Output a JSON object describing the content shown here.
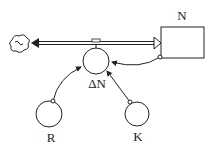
{
  "diagram": {
    "type": "stock-and-flow",
    "stock": {
      "label": "N"
    },
    "flow": {
      "label": "ΔN",
      "source": "cloud",
      "target": "N"
    },
    "converters": [
      {
        "label": "R"
      },
      {
        "label": "K"
      }
    ],
    "links": [
      {
        "from": "R",
        "to": "ΔN"
      },
      {
        "from": "K",
        "to": "ΔN"
      },
      {
        "from": "N",
        "to": "ΔN"
      }
    ]
  }
}
